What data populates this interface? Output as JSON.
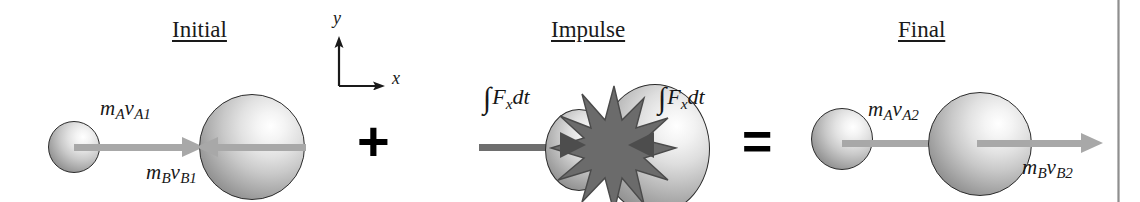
{
  "figure": {
    "type": "physics-diagram",
    "equation_form": "Initial + Impulse = Final"
  },
  "panels": {
    "initial": {
      "title": "Initial",
      "ball_a_label": {
        "m": "m",
        "m_sub": "A",
        "v": "v",
        "v_sub": "A1"
      },
      "ball_b_label": {
        "m": "m",
        "m_sub": "B",
        "v": "v",
        "v_sub": "B1"
      },
      "ball_a_direction": "right",
      "ball_b_direction": "left"
    },
    "impulse": {
      "title": "Impulse",
      "left_integral": {
        "sign": "∫",
        "f": "F",
        "f_sub": "x",
        "dt": "dt"
      },
      "right_integral": {
        "sign": "∫",
        "f": "F",
        "f_sub": "x",
        "dt": "dt"
      },
      "left_force_direction": "right",
      "right_force_direction": "left",
      "contact_effect": "starburst"
    },
    "final": {
      "title": "Final",
      "ball_a_label": {
        "m": "m",
        "m_sub": "A",
        "v": "v",
        "v_sub": "A2"
      },
      "ball_b_label": {
        "m": "m",
        "m_sub": "B",
        "v": "v",
        "v_sub": "B2"
      },
      "ball_a_direction": "right",
      "ball_b_direction": "right"
    }
  },
  "operators": {
    "plus": "+",
    "equals": "="
  },
  "axes": {
    "x_label": "x",
    "y_label": "y",
    "x_direction": "right",
    "y_direction": "up"
  },
  "colors": {
    "background": "#ffffff",
    "text": "#171717",
    "vector_gray": "#a8a8a8",
    "impulse_gray": "#6e6e6e",
    "arrowhead_dark": "#4d4d4d",
    "ball_outline": "#2b2b2b",
    "rule": "#8f8f8f"
  }
}
